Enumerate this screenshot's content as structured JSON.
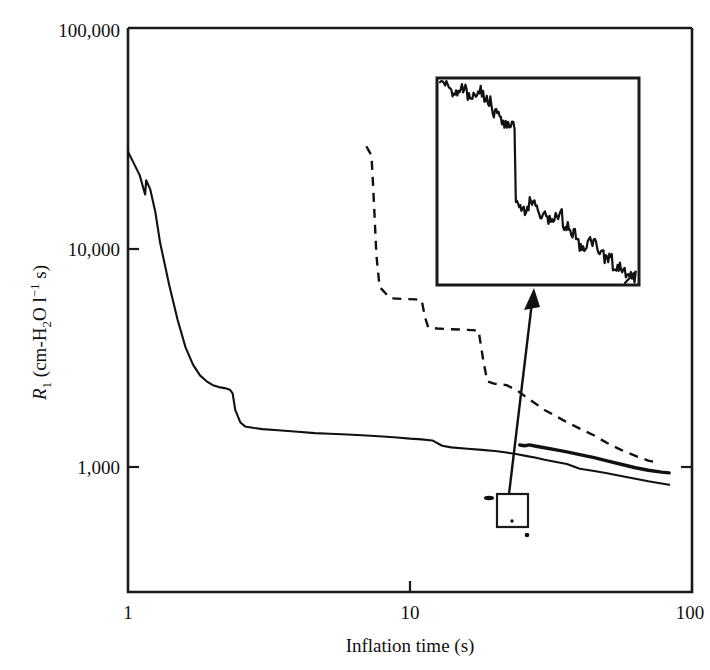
{
  "figure": {
    "kind": "scientific-line-chart",
    "background_color": "#ffffff",
    "ink_color": "#111111"
  },
  "axes": {
    "x": {
      "title": "Inflation time (s)",
      "scale": "log",
      "range": [
        1,
        100
      ],
      "tick_labels": [
        "1",
        "10",
        "100"
      ],
      "tick_values": [
        1,
        10,
        100
      ]
    },
    "y": {
      "title_parts": {
        "symbol": "R",
        "subscript": "1",
        "units_open": " (cm-H",
        "units_sub": "2",
        "units_mid": "O l",
        "units_sup": "−1",
        "units_close": " s)"
      },
      "title_plain": "R1 (cm-H2O l-1 s)",
      "scale": "log",
      "range": [
        100,
        100000
      ],
      "tick_labels": [
        "100,000",
        "10,000",
        "1,000"
      ],
      "tick_values": [
        100000,
        10000,
        1000
      ]
    }
  },
  "inset": {
    "name": "magnified-detail-inset",
    "description": "Magnified view of boxed region showing noisy descending staircase",
    "has_frame": true
  },
  "callout": {
    "name": "zoom-region-callout",
    "description": "Small rectangle on the main plot linked by an arrow to the inset"
  },
  "chart_data": {
    "type": "line",
    "title": "",
    "xlabel": "Inflation time (s)",
    "ylabel": "R1 (cm-H2O l-1 s)",
    "xscale": "log",
    "yscale": "log",
    "xlim": [
      1,
      100
    ],
    "ylim": [
      100,
      100000
    ],
    "grid": false,
    "legend": "none",
    "series": [
      {
        "name": "lower-solid-curve",
        "style": "solid-thin",
        "points": [
          [
            1.0,
            22000
          ],
          [
            1.1,
            16500
          ],
          [
            1.15,
            13000
          ],
          [
            1.16,
            15500
          ],
          [
            1.2,
            13800
          ],
          [
            1.25,
            10500
          ],
          [
            1.3,
            7200
          ],
          [
            1.4,
            4300
          ],
          [
            1.5,
            2800
          ],
          [
            1.6,
            2000
          ],
          [
            1.7,
            1620
          ],
          [
            1.8,
            1420
          ],
          [
            1.9,
            1320
          ],
          [
            2.0,
            1260
          ],
          [
            2.1,
            1230
          ],
          [
            2.2,
            1215
          ],
          [
            2.3,
            1190
          ],
          [
            2.35,
            1140
          ],
          [
            2.4,
            930
          ],
          [
            2.5,
            800
          ],
          [
            2.6,
            760
          ],
          [
            2.8,
            745
          ],
          [
            3.0,
            735
          ],
          [
            3.4,
            725
          ],
          [
            4.0,
            712
          ],
          [
            4.6,
            700
          ],
          [
            5.2,
            694
          ],
          [
            6.0,
            688
          ],
          [
            7.0,
            680
          ],
          [
            8.0,
            672
          ],
          [
            9.0,
            664
          ],
          [
            10.0,
            654
          ],
          [
            11.0,
            648
          ],
          [
            12.0,
            640
          ],
          [
            13.0,
            600
          ],
          [
            14.0,
            588
          ],
          [
            16.0,
            578
          ],
          [
            18.0,
            570
          ],
          [
            20.0,
            562
          ],
          [
            22.0,
            552
          ],
          [
            24.0,
            540
          ],
          [
            26.0,
            528
          ],
          [
            28.0,
            518
          ],
          [
            30.0,
            505
          ],
          [
            33.0,
            492
          ],
          [
            36.0,
            480
          ],
          [
            40.0,
            452
          ],
          [
            45.0,
            440
          ],
          [
            50.0,
            428
          ],
          [
            56.0,
            414
          ],
          [
            63.0,
            400
          ],
          [
            70.0,
            388
          ],
          [
            78.0,
            378
          ],
          [
            83.0,
            372
          ]
        ]
      },
      {
        "name": "middle-thick-solid-curve",
        "style": "solid-thick",
        "points": [
          [
            24.5,
            605
          ],
          [
            25.5,
            600
          ],
          [
            26.5,
            606
          ],
          [
            28.0,
            596
          ],
          [
            30.0,
            585
          ],
          [
            33.0,
            570
          ],
          [
            36.0,
            556
          ],
          [
            40.0,
            538
          ],
          [
            45.0,
            518
          ],
          [
            50.0,
            498
          ],
          [
            56.0,
            478
          ],
          [
            63.0,
            458
          ],
          [
            70.0,
            444
          ],
          [
            78.0,
            434
          ],
          [
            83.0,
            430
          ]
        ]
      },
      {
        "name": "upper-dashed-curve",
        "style": "dashed",
        "points": [
          [
            7.0,
            23500
          ],
          [
            7.3,
            21000
          ],
          [
            7.4,
            14500
          ],
          [
            7.5,
            9500
          ],
          [
            7.6,
            6200
          ],
          [
            7.8,
            4200
          ],
          [
            8.5,
            3650
          ],
          [
            9.5,
            3620
          ],
          [
            10.5,
            3600
          ],
          [
            11.0,
            3560
          ],
          [
            11.3,
            2900
          ],
          [
            11.6,
            2560
          ],
          [
            12.5,
            2520
          ],
          [
            14.0,
            2500
          ],
          [
            16.0,
            2480
          ],
          [
            17.5,
            2460
          ],
          [
            18.2,
            1700
          ],
          [
            18.8,
            1320
          ],
          [
            20.0,
            1280
          ],
          [
            22.0,
            1260
          ],
          [
            24.0,
            1180
          ],
          [
            26.0,
            1080
          ],
          [
            28.0,
            1000
          ],
          [
            30.0,
            930
          ],
          [
            33.0,
            860
          ],
          [
            36.0,
            800
          ],
          [
            40.0,
            740
          ],
          [
            45.0,
            680
          ],
          [
            50.0,
            620
          ],
          [
            56.0,
            570
          ],
          [
            63.0,
            530
          ],
          [
            70.0,
            500
          ],
          [
            76.0,
            486
          ]
        ]
      }
    ],
    "inset_series": {
      "name": "inset-magnified-trace",
      "style": "solid-thin",
      "note": "Noisy monotonically-decreasing staircase spanning the inset box from upper-left to lower-right"
    }
  }
}
